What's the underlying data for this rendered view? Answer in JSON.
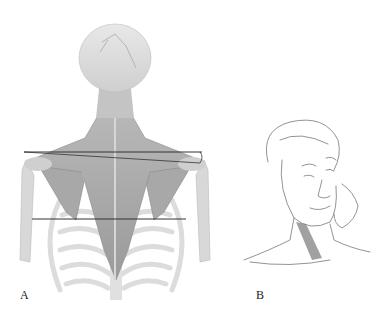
{
  "figure": {
    "panels": [
      {
        "id": "A",
        "label": "A",
        "description": "Posterior view of skull, neck, trapezius, scapulae and rib cage with horizontal reference lines",
        "annotations": [
          "upper-shoulder-reference-line",
          "shoulder-height-bracket",
          "inferior-scapular-angle-line"
        ]
      },
      {
        "id": "B",
        "label": "B",
        "description": "Line drawing of woman tilting head with hand on cheek, sternocleidomastoid muscle shaded"
      }
    ],
    "colors": {
      "bone": "#e4e4e4",
      "muscle": "#a9a9a9",
      "muscle_dark": "#8c8c8c",
      "line": "#333333",
      "sketch": "#777777",
      "background": "#ffffff"
    }
  }
}
